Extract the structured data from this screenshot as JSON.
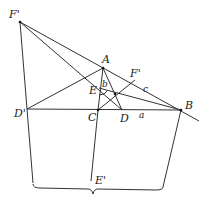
{
  "points": {
    "F_prime_top": {
      "label": "F'",
      "x": 20,
      "y": 22
    },
    "A": {
      "label": "A",
      "x": 103,
      "y": 68
    },
    "F": {
      "label": "F",
      "x": 135,
      "y": 80
    },
    "B": {
      "label": "B",
      "x": 181,
      "y": 110
    },
    "C": {
      "label": "C",
      "x": 98,
      "y": 110
    },
    "D": {
      "label": "D",
      "x": 122,
      "y": 110
    },
    "D_prime": {
      "label": "D'",
      "x": 27,
      "y": 109
    },
    "E": {
      "label": "E",
      "x": 99,
      "y": 88
    },
    "I": {
      "label": "",
      "x": 115,
      "y": 94
    },
    "E_prime": {
      "label": "E'",
      "x": 91,
      "y": 181
    }
  },
  "labels": {
    "F_prime_top": "F'",
    "A": "A",
    "F": "F'",
    "c": "c",
    "b": "b",
    "E": "E",
    "D_prime": "D'",
    "C": "C",
    "D": "D",
    "a": "a",
    "B": "B",
    "E_prime": "E'"
  },
  "colors": {
    "line": "#333333",
    "text": "#222222",
    "background": "#ffffff"
  }
}
